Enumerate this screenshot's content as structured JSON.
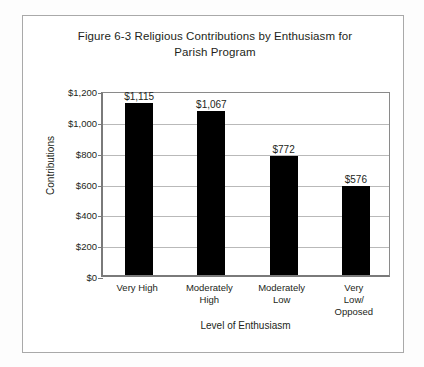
{
  "chart_data": {
    "type": "bar",
    "title": "Figure 6-3 Religious Contributions by Enthusiasm for Parish Program",
    "title_line1": "Figure 6-3 Religious Contributions by Enthusiasm for",
    "title_line2": "Parish Program",
    "xlabel": "Level of Enthusiasm",
    "ylabel": "Contributions",
    "categories": [
      "Very High",
      "Moderately High",
      "Moderately Low",
      "Very Low/ Opposed"
    ],
    "category_lines": [
      [
        "Very High"
      ],
      [
        "Moderately",
        "High"
      ],
      [
        "Moderately",
        "Low"
      ],
      [
        "Very Low/",
        "Opposed"
      ]
    ],
    "values": [
      1115,
      1067,
      772,
      576
    ],
    "value_labels": [
      "$1,115",
      "$1,067",
      "$772",
      "$576"
    ],
    "ylim": [
      0,
      1200
    ],
    "ytick_values": [
      1200,
      1000,
      800,
      600,
      400,
      200,
      0
    ],
    "ytick_labels": [
      "$1,200",
      "$1,000",
      "$800",
      "$600",
      "$400",
      "$200",
      "$0"
    ],
    "grid": true,
    "legend": false,
    "bar_color": "#000000",
    "gridline_color": "#b9b9b9",
    "axis_color": "#7a7a7a",
    "text_color": "#231f20",
    "background_color": "#ffffff"
  }
}
